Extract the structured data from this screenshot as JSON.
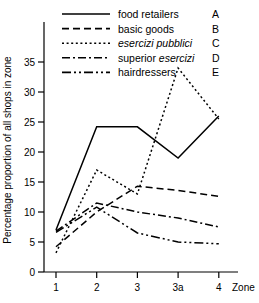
{
  "chart_data": {
    "type": "line",
    "title": "",
    "xlabel": "Zone",
    "ylabel": "Percentage proportion of all shops in zone",
    "categories": [
      "1",
      "2",
      "3",
      "3a",
      "4"
    ],
    "xtick_labels": [
      "1",
      "2",
      "3",
      "3a",
      "4"
    ],
    "ytick_labels": [
      "0",
      "5",
      "10",
      "15",
      "20",
      "25",
      "30",
      "35"
    ],
    "ylim": [
      0,
      35
    ],
    "ytick_step": 5,
    "grid": false,
    "legend_position": "top-center",
    "series": [
      {
        "name": "food retailers",
        "key": "A",
        "style": "solid",
        "values": [
          7.0,
          24.2,
          24.2,
          19.0,
          26.0
        ]
      },
      {
        "name": "basic goods",
        "key": "B",
        "style": "dashed",
        "values": [
          4.2,
          10.0,
          14.3,
          13.6,
          12.6
        ]
      },
      {
        "name": "esercizi pubblici",
        "key": "C",
        "style": "dotted",
        "values": [
          3.2,
          17.0,
          13.0,
          34.0,
          25.5
        ],
        "italic": true
      },
      {
        "name": "superior esercizi",
        "key": "D",
        "style": "dashdot",
        "values": [
          6.8,
          11.5,
          10.0,
          9.0,
          7.5
        ],
        "italic_word": "esercizi"
      },
      {
        "name": "hairdressers",
        "key": "E",
        "style": "dashdotdot",
        "values": [
          6.6,
          10.8,
          6.5,
          5.0,
          4.7
        ]
      }
    ]
  },
  "axis": {
    "y_title": "Percentage proportion of all shops in zone",
    "x_title": "Zone"
  }
}
